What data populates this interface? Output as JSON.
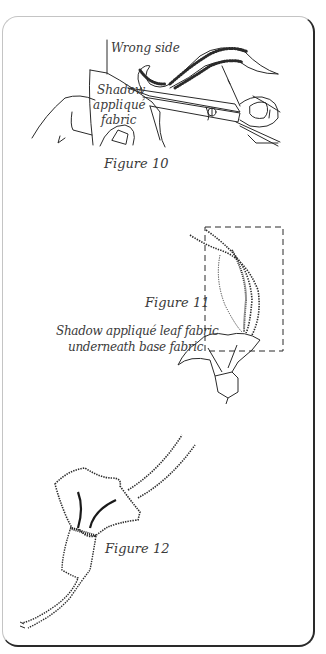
{
  "figures": [
    {
      "id": "figure-10",
      "caption": "Figure 10",
      "labels": {
        "wrong_side": "Wrong side",
        "shadow_line1": "Shadow",
        "shadow_line2": "appliqué",
        "shadow_line3": "fabric"
      }
    },
    {
      "id": "figure-11",
      "caption": "Figure 11",
      "labels": {
        "note_line1": "Shadow appliqué leaf fabric",
        "note_line2": "underneath base fabric"
      }
    },
    {
      "id": "figure-12",
      "caption": "Figure 12",
      "labels": {}
    }
  ],
  "colors": {
    "line": "#2a2a2a",
    "text": "#3a3a3a",
    "border_light": "#c4c4c4"
  }
}
